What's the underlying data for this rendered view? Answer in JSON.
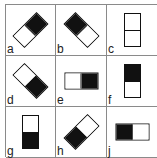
{
  "puzzle": {
    "cells": [
      {
        "label": "a",
        "rotation": 45,
        "top": "black",
        "bottom": "white"
      },
      {
        "label": "b",
        "rotation": -45,
        "top": "black",
        "bottom": "white"
      },
      {
        "label": "c",
        "rotation": 0,
        "top": "white",
        "bottom": "white"
      },
      {
        "label": "d",
        "rotation": -45,
        "top": "white",
        "bottom": "black"
      },
      {
        "label": "e",
        "rotation": 90,
        "top": "black",
        "bottom": "white"
      },
      {
        "label": "f",
        "rotation": 0,
        "top": "black",
        "bottom": "white"
      },
      {
        "label": "g",
        "rotation": 0,
        "top": "white",
        "bottom": "black"
      },
      {
        "label": "h",
        "rotation": 45,
        "top": "white",
        "bottom": "black"
      },
      {
        "label": "j",
        "rotation": 90,
        "top": "white",
        "bottom": "black"
      }
    ],
    "colors": {
      "ink": "#111111",
      "grid_line": "#8a8a8a",
      "background": "#ffffff"
    }
  }
}
